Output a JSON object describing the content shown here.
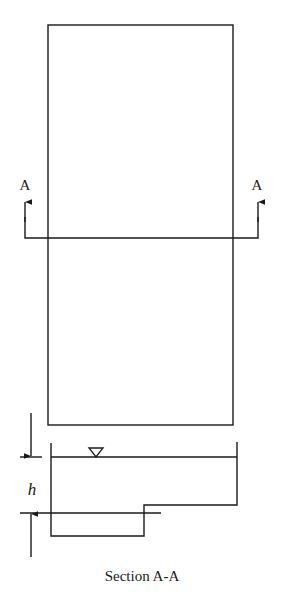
{
  "figure": {
    "type": "engineering-section-drawing",
    "section_markers": {
      "left_label": "A",
      "right_label": "A"
    },
    "dimension_label": "h",
    "caption": "Section A-A",
    "symbols": {
      "water_surface": "inverted-triangle"
    },
    "colors": {
      "line": "#1a1a1a",
      "background": "#ffffff"
    }
  }
}
